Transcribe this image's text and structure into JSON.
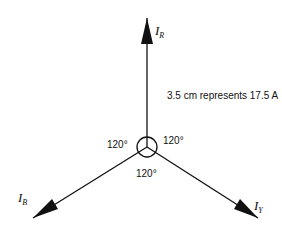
{
  "diagram": {
    "type": "phasor-diagram",
    "scale_note": "3.5 cm represents 17.5 A",
    "phasors": [
      {
        "name": "I",
        "subscript": "R",
        "direction_deg": 90
      },
      {
        "name": "I",
        "subscript": "B",
        "direction_deg": 210
      },
      {
        "name": "I",
        "subscript": "Y",
        "direction_deg": 330
      }
    ],
    "angles": [
      {
        "label": "120°",
        "position": "left"
      },
      {
        "label": "120°",
        "position": "right"
      },
      {
        "label": "120°",
        "position": "bottom"
      }
    ],
    "colors": {
      "line": "#111111",
      "background": "#ffffff"
    }
  }
}
